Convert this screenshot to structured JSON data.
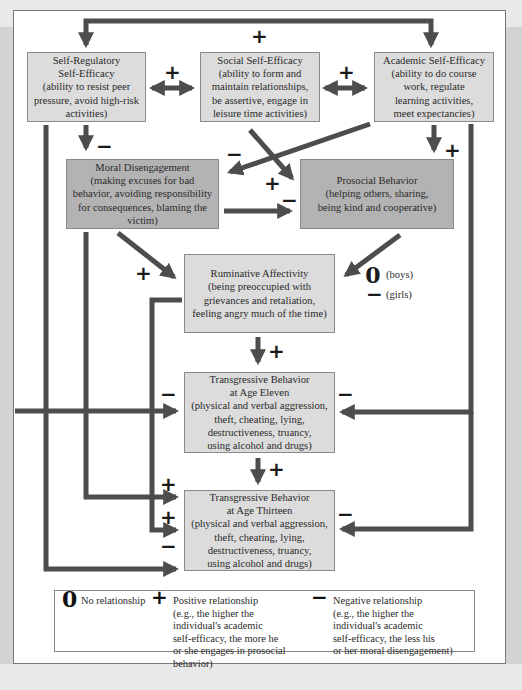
{
  "diagram": {
    "boxes": {
      "self_regulatory": {
        "lines": [
          "Self-Regulatory",
          "Self-Efficacy",
          "(ability to resist peer",
          "pressure, avoid high-risk",
          "activities)"
        ]
      },
      "social": {
        "lines": [
          "Social Self-Efficacy",
          "(ability to form and",
          "maintain relationships,",
          "be assertive, engage in",
          "leisure time activities)"
        ]
      },
      "academic": {
        "lines": [
          "Academic Self-Efficacy",
          "(ability to do course",
          "work, regulate",
          "learning activities,",
          "meet expectancies)"
        ]
      },
      "moral_disengagement": {
        "lines": [
          "Moral Disengagement",
          "(making excuses for bad",
          "behavior, avoiding responsibility",
          "for consequences, blaming the",
          "victim)"
        ]
      },
      "prosocial": {
        "lines": [
          "Prosocial Behavior",
          "(helping others, sharing,",
          "being kind and cooperative)"
        ]
      },
      "ruminative": {
        "lines": [
          "Ruminative Affectivity",
          "(being preoccupied with",
          "grievances and retaliation,",
          "feeling angry much of the time)"
        ]
      },
      "transgressive_11": {
        "lines": [
          "Transgressive Behavior",
          "at Age Eleven",
          "(physical and verbal aggression,",
          "theft, cheating, lying,",
          "destructiveness, truancy,",
          "using alcohol and drugs)"
        ]
      },
      "transgressive_13": {
        "lines": [
          "Transgressive Behavior",
          "at Age Thirteen",
          "(physical and verbal aggression,",
          "theft, cheating, lying,",
          "destructiveness, truancy,",
          "using alcohol and drugs)"
        ]
      }
    },
    "signs": {
      "top_loop": "+",
      "selfreg_social": "+",
      "social_academic": "+",
      "selfreg_to_moral": "−",
      "academic_to_moral": "−",
      "social_to_prosocial": "+",
      "moral_to_prosocial": "−",
      "academic_to_prosocial": "+",
      "moral_to_ruminative": "+",
      "prosocial_to_ruminative_boys": "0",
      "prosocial_to_ruminative_girls": "−",
      "ruminative_to_t11": "+",
      "left_to_t11": "−",
      "right_to_t11": "−",
      "t11_to_t13": "+",
      "moral_to_t13": "+",
      "ruminative_to_t13": "+",
      "selfreg_to_t13": "−",
      "right_to_t13": "−"
    },
    "gender_notes": {
      "boys": "(boys)",
      "girls": "(girls)"
    }
  },
  "legend": {
    "none": {
      "glyph": "0",
      "label": "No relationship"
    },
    "positive": {
      "glyph": "+",
      "lines": [
        "Positive relationship",
        "(e.g., the higher the",
        "individual's academic",
        "self-efficacy, the more he",
        "or she engages in prosocial",
        "behavior)"
      ]
    },
    "negative": {
      "glyph": "−",
      "lines": [
        "Negative relationship",
        "(e.g., the higher the",
        "individual's academic",
        "self-efficacy, the less his",
        "or her moral disengagement)"
      ]
    }
  },
  "colors": {
    "box_light": "#dcdcdc",
    "box_dark": "#b3b3b3",
    "arrow": "#4d4d4d",
    "frame_bg": "#ffffff",
    "page_bg": "#d3d3d3"
  }
}
